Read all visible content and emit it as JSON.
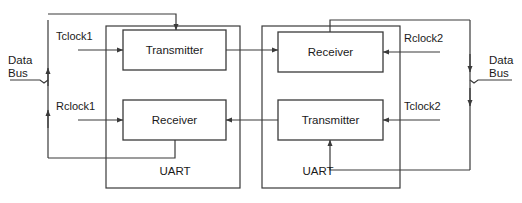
{
  "diagram": {
    "colors": {
      "line": "#3a3a3a",
      "text": "#1a1a1a",
      "background": "#ffffff"
    },
    "uart_left": {
      "label": "UART",
      "blocks": {
        "transmitter": "Transmitter",
        "receiver": "Receiver"
      },
      "clocks": {
        "transmit": "Tclock1",
        "receive": "Rclock1"
      },
      "bus": {
        "line1": "Data",
        "line2": "Bus"
      }
    },
    "uart_right": {
      "label": "UART",
      "blocks": {
        "receiver": "Receiver",
        "transmitter": "Transmitter"
      },
      "clocks": {
        "receive": "Rclock2",
        "transmit": "Tclock2"
      },
      "bus": {
        "line1": "Data",
        "line2": "Bus"
      }
    }
  }
}
